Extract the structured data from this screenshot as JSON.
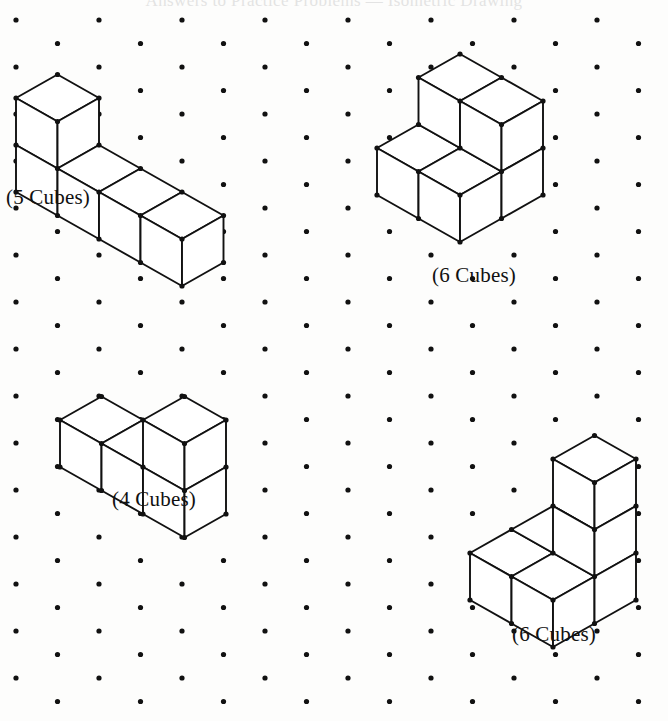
{
  "page": {
    "width": 668,
    "height": 721,
    "background_color": "#fdfdfc",
    "ink_color": "#111111",
    "header_faint_text": "Answers to Practice Problems — Isometric Drawing"
  },
  "grid": {
    "type": "isometric-dot-grid",
    "dot_color": "#111111",
    "dot_radius": 2.6,
    "origin_x": 16,
    "origin_y": 20,
    "col_spacing": 41.5,
    "row_spacing": 47,
    "odd_col_offset_y": 23.5,
    "cols": 17,
    "rows": 17
  },
  "figures": [
    {
      "id": "figure-1",
      "label": "(5 Cubes)",
      "cube_count": 5,
      "label_x": 6,
      "label_y": 185,
      "description": "L-shaped solid: a long 4-cube bar with one cube stacked on the near-left end",
      "origin_x": 16,
      "origin_y": 185,
      "unit": 41.5,
      "polylines": [
        [
          [
            57,
            20
          ],
          [
            16,
            43
          ],
          [
            16,
            185
          ],
          [
            57,
            208
          ],
          [
            306,
            67
          ],
          [
            306,
            185
          ],
          [
            222,
            232
          ],
          [
            140,
            185
          ],
          [
            140,
            90
          ],
          [
            98,
            67
          ]
        ],
        [
          [
            57,
            20
          ],
          [
            140,
            67
          ],
          [
            140,
            185
          ]
        ],
        [
          [
            16,
            43
          ],
          [
            140,
            67
          ]
        ],
        [
          [
            140,
            67
          ],
          [
            306,
            67
          ]
        ],
        [
          [
            16,
            185
          ],
          [
            140,
            232
          ],
          [
            222,
            232
          ]
        ],
        [
          [
            140,
            232
          ],
          [
            140,
            185
          ]
        ],
        [
          [
            57,
            208
          ],
          [
            140,
            255
          ]
        ],
        [
          [
            306,
            185
          ],
          [
            306,
            67
          ]
        ]
      ]
    },
    {
      "id": "figure-2",
      "label": "(6 Cubes)",
      "cube_count": 6,
      "label_x": 432,
      "label_y": 263,
      "description": "Six cubes: a 2x2 arrangement of top faces with stepped lower row",
      "origin_x": 356,
      "origin_y": 92,
      "unit": 41.5
    },
    {
      "id": "figure-3",
      "label": "(4 Cubes)",
      "cube_count": 4,
      "label_x": 112,
      "label_y": 487,
      "description": "Stepped solid: 3-cube low bar with one cube raised at the back-right",
      "origin_x": 60,
      "origin_y": 320,
      "unit": 41.5
    },
    {
      "id": "figure-4",
      "label": "(6 Cubes)",
      "cube_count": 6,
      "label_x": 512,
      "label_y": 622,
      "description": "2x2 base block with a two-cube tower rising at the back-right",
      "origin_x": 470,
      "origin_y": 415,
      "unit": 41.5
    }
  ]
}
